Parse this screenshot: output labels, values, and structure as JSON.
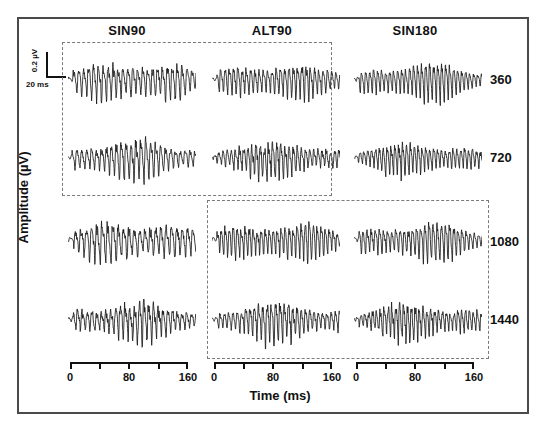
{
  "figure": {
    "y_axis_title": "Amplitude (µV)",
    "x_axis_title": "Time (ms)",
    "columns": [
      "SIN90",
      "ALT90",
      "SIN180"
    ],
    "rows": [
      "360",
      "720",
      "1080",
      "1440"
    ],
    "scalebar": {
      "vertical_label": "0.2 µV",
      "horizontal_label": "20 ms"
    },
    "xaxis": {
      "ticks": [
        0,
        40,
        80,
        120,
        160
      ],
      "tick_labels": [
        "0",
        "",
        "80",
        "",
        "160"
      ],
      "min": 0,
      "max": 160,
      "unit": "ms"
    },
    "highlight_boxes": [
      {
        "name": "box-a",
        "columns": [
          "SIN90",
          "ALT90"
        ],
        "rows": [
          "360",
          "720"
        ],
        "style": "dashed"
      },
      {
        "name": "box-b",
        "columns": [
          "ALT90",
          "SIN180"
        ],
        "rows": [
          "1080",
          "1440"
        ],
        "style": "dashed"
      }
    ],
    "colors": {
      "trace": "#1a1a1a",
      "frame": "#4a4a4a",
      "dash": "#7a7a7a",
      "background": "#ffffff"
    }
  },
  "chart_data": {
    "type": "line",
    "title": "",
    "xlabel": "Time (ms)",
    "ylabel": "Amplitude (µV)",
    "xlim": [
      0,
      160
    ],
    "grid": false,
    "legend": "none",
    "layout": {
      "rows": 4,
      "cols": 3
    },
    "col_categories": [
      "SIN90",
      "ALT90",
      "SIN180"
    ],
    "row_categories": [
      "360",
      "720",
      "1080",
      "1440"
    ],
    "row_units": "Hz",
    "scale_bar": {
      "amplitude": 0.2,
      "amplitude_unit": "µV",
      "time": 20,
      "time_unit": "ms"
    },
    "panels": [
      {
        "row": "360",
        "col": "SIN90",
        "cycles": 26,
        "amplitude": 0.9,
        "noise": 0.3,
        "onset_ms": 6
      },
      {
        "row": "360",
        "col": "ALT90",
        "cycles": 30,
        "amplitude": 0.8,
        "noise": 0.26,
        "onset_ms": 6
      },
      {
        "row": "360",
        "col": "SIN180",
        "cycles": 32,
        "amplitude": 0.85,
        "noise": 0.22,
        "onset_ms": 6
      },
      {
        "row": "720",
        "col": "SIN90",
        "cycles": 26,
        "amplitude": 0.88,
        "noise": 0.32,
        "onset_ms": 5
      },
      {
        "row": "720",
        "col": "ALT90",
        "cycles": 31,
        "amplitude": 0.78,
        "noise": 0.34,
        "onset_ms": 5
      },
      {
        "row": "720",
        "col": "SIN180",
        "cycles": 33,
        "amplitude": 0.7,
        "noise": 0.24,
        "onset_ms": 5
      },
      {
        "row": "1080",
        "col": "SIN90",
        "cycles": 24,
        "amplitude": 0.92,
        "noise": 0.34,
        "onset_ms": 7
      },
      {
        "row": "1080",
        "col": "ALT90",
        "cycles": 32,
        "amplitude": 0.86,
        "noise": 0.28,
        "onset_ms": 6
      },
      {
        "row": "1080",
        "col": "SIN180",
        "cycles": 31,
        "amplitude": 0.84,
        "noise": 0.26,
        "onset_ms": 6
      },
      {
        "row": "1440",
        "col": "SIN90",
        "cycles": 27,
        "amplitude": 0.82,
        "noise": 0.36,
        "onset_ms": 6
      },
      {
        "row": "1440",
        "col": "ALT90",
        "cycles": 30,
        "amplitude": 0.88,
        "noise": 0.3,
        "onset_ms": 7
      },
      {
        "row": "1440",
        "col": "SIN180",
        "cycles": 33,
        "amplitude": 0.8,
        "noise": 0.32,
        "onset_ms": 6
      }
    ]
  }
}
